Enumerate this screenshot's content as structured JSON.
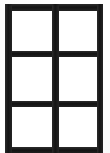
{
  "image": {
    "width": 110,
    "height": 153,
    "background_color": "#ffffff",
    "subject": "blank two-column three-row ruled grid",
    "description": "Scanned blank grid of six empty rectangular cells enclosed by a thick dark border"
  },
  "grid": {
    "columns": 2,
    "rows": 3,
    "cell_count": 6,
    "line_color": "#1b1b1b",
    "cell_fill_color": "#ffffff",
    "line_thickness_px": 6,
    "outer_border": {
      "left_px": 5,
      "top_px": 4,
      "right_px": 103,
      "bottom_cropped": true
    },
    "vertical_dividers_px": [
      52
    ],
    "horizontal_dividers_px": [
      52,
      103
    ],
    "cells": [
      {
        "id": "cell-r1c1",
        "row": 1,
        "column": 1,
        "content": ""
      },
      {
        "id": "cell-r1c2",
        "row": 1,
        "column": 2,
        "content": ""
      },
      {
        "id": "cell-r2c1",
        "row": 2,
        "column": 1,
        "content": ""
      },
      {
        "id": "cell-r2c2",
        "row": 2,
        "column": 2,
        "content": ""
      },
      {
        "id": "cell-r3c1",
        "row": 3,
        "column": 1,
        "content": ""
      },
      {
        "id": "cell-r3c2",
        "row": 3,
        "column": 2,
        "content": ""
      }
    ]
  }
}
